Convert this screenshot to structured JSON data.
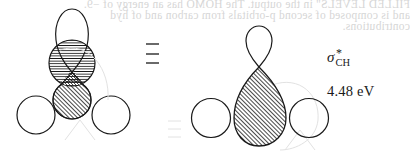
{
  "figure": {
    "left_diagram": {
      "description": "Combination of three H 1s orbitals and a carbon p-type lobe overlapping a carbon sp-hybrid (horizontal hatching) and lower lobe (diagonal hatching)",
      "components": [
        "top-lobe-outline",
        "horizontal-hatched-circle",
        "diagonal-hatched-lower-circle",
        "cross-hatched-overlap",
        "left-hydrogen-circle",
        "right-hydrogen-circle"
      ]
    },
    "equivalence_symbol": "≡",
    "right_diagram": {
      "description": "Resulting antibonding orbital: small upper lobe, large hatched lower teardrop lobe, flanked by two hydrogen circles",
      "components": [
        "small-top-lobe",
        "large-hatched-teardrop",
        "left-hydrogen-circle",
        "right-hydrogen-circle"
      ]
    },
    "orbital_label": {
      "symbol": "σ",
      "superscript": "*",
      "subscript": "CH"
    },
    "energy_label": "4.48 eV"
  },
  "bleed_through_text": {
    "line1": "FILLED LEVELS\" in the output. The HOMO has an energy of −9.",
    "line2": "and is composed of second p-orbitals from carbon and of hyd",
    "line3": "contributions."
  },
  "colors": {
    "ink": "#1a1a1a",
    "background": "#ffffff",
    "bleed": "#d6d6d6"
  }
}
